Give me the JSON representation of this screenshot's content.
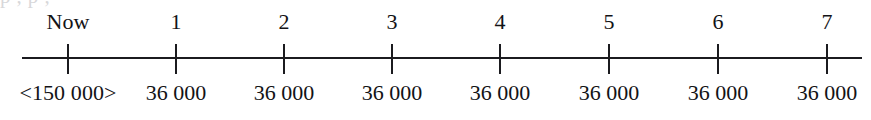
{
  "diagram": {
    "type": "cash-flow-timeline",
    "clipped_text_above": "p ,  p  ,",
    "axis": {
      "line_color": "#1b1b1f",
      "tick_color": "#1b1b1f",
      "start_x": 22,
      "end_x": 862,
      "baseline_y": 58,
      "tick_top_y": 44,
      "tick_bottom_y": 74
    },
    "text_color": "#131316",
    "background_color": "#ffffff",
    "periods": [
      {
        "index": 0,
        "period_label": "Now",
        "amount_label": "<150 000>",
        "amount_value": -150000,
        "x": 68
      },
      {
        "index": 1,
        "period_label": "1",
        "amount_label": "36 000",
        "amount_value": 36000,
        "x": 176
      },
      {
        "index": 2,
        "period_label": "2",
        "amount_label": "36 000",
        "amount_value": 36000,
        "x": 284
      },
      {
        "index": 3,
        "period_label": "3",
        "amount_label": "36 000",
        "amount_value": 36000,
        "x": 392
      },
      {
        "index": 4,
        "period_label": "4",
        "amount_label": "36 000",
        "amount_value": 36000,
        "x": 500
      },
      {
        "index": 5,
        "period_label": "5",
        "amount_label": "36 000",
        "amount_value": 36000,
        "x": 609
      },
      {
        "index": 6,
        "period_label": "6",
        "amount_label": "36 000",
        "amount_value": 36000,
        "x": 718
      },
      {
        "index": 7,
        "period_label": "7",
        "amount_label": "36 000",
        "amount_value": 36000,
        "x": 827
      }
    ]
  }
}
